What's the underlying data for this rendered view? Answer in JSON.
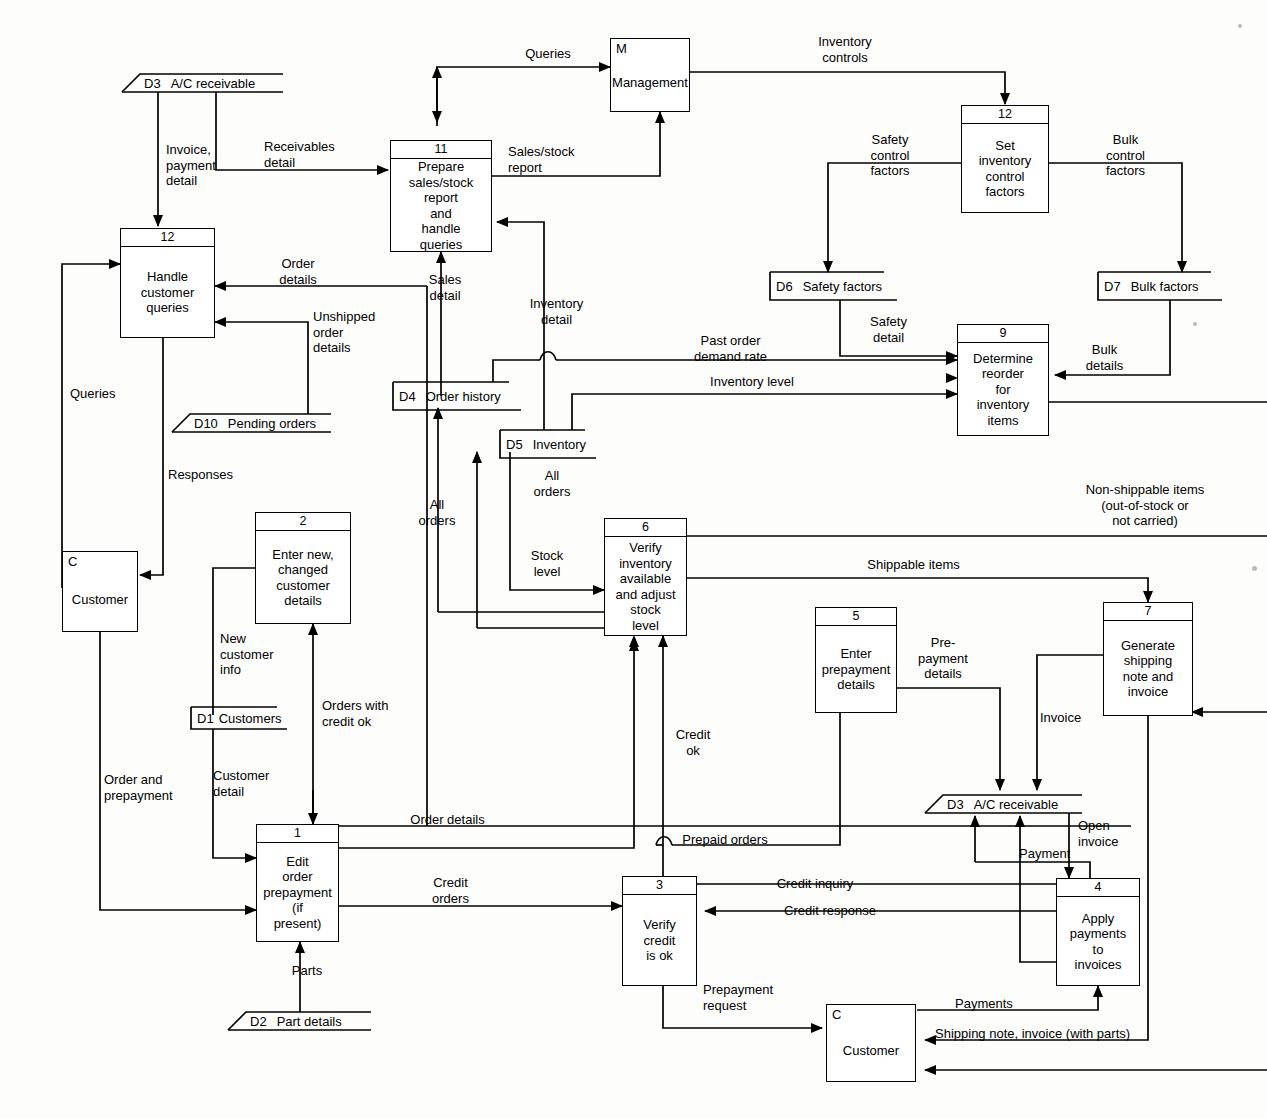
{
  "diagram": {
    "type": "data-flow-diagram",
    "ink_color": "#000000",
    "paper_color": "#fdfdfb"
  },
  "processes": [
    {
      "id": "p12h",
      "num": "12",
      "label": "Handle\ncustomer\nqueries"
    },
    {
      "id": "p11",
      "num": "11",
      "label": "Prepare\nsales/stock\nreport\nand\nhandle\nqueries"
    },
    {
      "id": "p12s",
      "num": "12",
      "label": "Set\ninventory\ncontrol\nfactors"
    },
    {
      "id": "p9",
      "num": "9",
      "label": "Determine\nreorder\nfor\ninventory\nitems"
    },
    {
      "id": "p2",
      "num": "2",
      "label": "Enter new,\nchanged\ncustomer\ndetails"
    },
    {
      "id": "p6",
      "num": "6",
      "label": "Verify\ninventory\navailable\nand adjust\nstock\nlevel"
    },
    {
      "id": "p5",
      "num": "5",
      "label": "Enter\nprepayment\ndetails"
    },
    {
      "id": "p7",
      "num": "7",
      "label": "Generate\nshipping\nnote and\ninvoice"
    },
    {
      "id": "p1",
      "num": "1",
      "label": "Edit\norder\nprepayment\n(if\npresent)"
    },
    {
      "id": "p3",
      "num": "3",
      "label": "Verify\ncredit\nis ok"
    },
    {
      "id": "p4",
      "num": "4",
      "label": "Apply\npayments\nto\ninvoices"
    }
  ],
  "externals": [
    {
      "id": "mgmt",
      "code": "M",
      "name": "Management"
    },
    {
      "id": "cust1",
      "code": "C",
      "name": "Customer"
    },
    {
      "id": "cust2",
      "code": "C",
      "name": "Customer"
    }
  ],
  "stores": [
    {
      "id": "d3top",
      "code": "D3",
      "name": "A/C receivable",
      "shape": "slanted"
    },
    {
      "id": "d10",
      "code": "D10",
      "name": "Pending orders",
      "shape": "slanted"
    },
    {
      "id": "d6",
      "code": "D6",
      "name": "Safety factors",
      "shape": "rect"
    },
    {
      "id": "d7",
      "code": "D7",
      "name": "Bulk factors",
      "shape": "rect"
    },
    {
      "id": "d4",
      "code": "D4",
      "name": "Order history",
      "shape": "rect"
    },
    {
      "id": "d5",
      "code": "D5",
      "name": "Inventory",
      "shape": "rect"
    },
    {
      "id": "d1",
      "code": "D1",
      "name": "Customers",
      "shape": "rect"
    },
    {
      "id": "d2",
      "code": "D2",
      "name": "Part details",
      "shape": "slanted"
    },
    {
      "id": "d3bot",
      "code": "D3",
      "name": "A/C receivable",
      "shape": "slanted"
    }
  ],
  "flows": [
    {
      "id": "f-queries-mgmt",
      "label": "Queries"
    },
    {
      "id": "f-inventory-controls",
      "label": "Inventory\ncontrols"
    },
    {
      "id": "f-invoice-payment",
      "label": "Invoice,\npayment\ndetail"
    },
    {
      "id": "f-receivables-detail",
      "label": "Receivables\ndetail"
    },
    {
      "id": "f-sales-stock-report",
      "label": "Sales/stock\nreport"
    },
    {
      "id": "f-safety-control",
      "label": "Safety\ncontrol\nfactors"
    },
    {
      "id": "f-bulk-control",
      "label": "Bulk\ncontrol\nfactors"
    },
    {
      "id": "f-order-details-top",
      "label": "Order\ndetails"
    },
    {
      "id": "f-unshipped",
      "label": "Unshipped\norder\ndetails"
    },
    {
      "id": "f-safety-detail",
      "label": "Safety\ndetail"
    },
    {
      "id": "f-bulk-details",
      "label": "Bulk\ndetails"
    },
    {
      "id": "f-past-order",
      "label": "Past order\ndemand rate"
    },
    {
      "id": "f-inventory-level",
      "label": "Inventory level"
    },
    {
      "id": "f-sales-detail",
      "label": "Sales\ndetail"
    },
    {
      "id": "f-inventory-detail",
      "label": "Inventory\ndetail"
    },
    {
      "id": "f-queries-left",
      "label": "Queries"
    },
    {
      "id": "f-responses",
      "label": "Responses"
    },
    {
      "id": "f-all-orders-d4",
      "label": "All\norders"
    },
    {
      "id": "f-all-orders-d5",
      "label": "All\norders"
    },
    {
      "id": "f-stock-level",
      "label": "Stock\nlevel"
    },
    {
      "id": "f-nonshippable",
      "label": "Non-shippable items\n(out-of-stock or\nnot carried)"
    },
    {
      "id": "f-shippable",
      "label": "Shippable items"
    },
    {
      "id": "f-new-customer-info",
      "label": "New\ncustomer\ninfo"
    },
    {
      "id": "f-orders-credit-ok",
      "label": "Orders with\ncredit ok"
    },
    {
      "id": "f-customer-detail",
      "label": "Customer\ndetail"
    },
    {
      "id": "f-order-prepayment",
      "label": "Order and\nprepayment"
    },
    {
      "id": "f-credit-ok",
      "label": "Credit\nok"
    },
    {
      "id": "f-prepayment-details",
      "label": "Pre-\npayment\ndetails"
    },
    {
      "id": "f-invoice",
      "label": "Invoice"
    },
    {
      "id": "f-open-invoice",
      "label": "Open\ninvoice"
    },
    {
      "id": "f-payment",
      "label": "Payment"
    },
    {
      "id": "f-order-details-bot",
      "label": "Order details"
    },
    {
      "id": "f-prepaid-orders",
      "label": "Prepaid orders"
    },
    {
      "id": "f-credit-inquiry",
      "label": "Credit inquiry"
    },
    {
      "id": "f-credit-response",
      "label": "Credit response"
    },
    {
      "id": "f-credit-orders",
      "label": "Credit\norders"
    },
    {
      "id": "f-parts",
      "label": "Parts"
    },
    {
      "id": "f-prepayment-request",
      "label": "Prepayment\nrequest"
    },
    {
      "id": "f-payments",
      "label": "Payments"
    },
    {
      "id": "f-shipping-note",
      "label": "Shipping note, invoice (with parts)"
    }
  ]
}
